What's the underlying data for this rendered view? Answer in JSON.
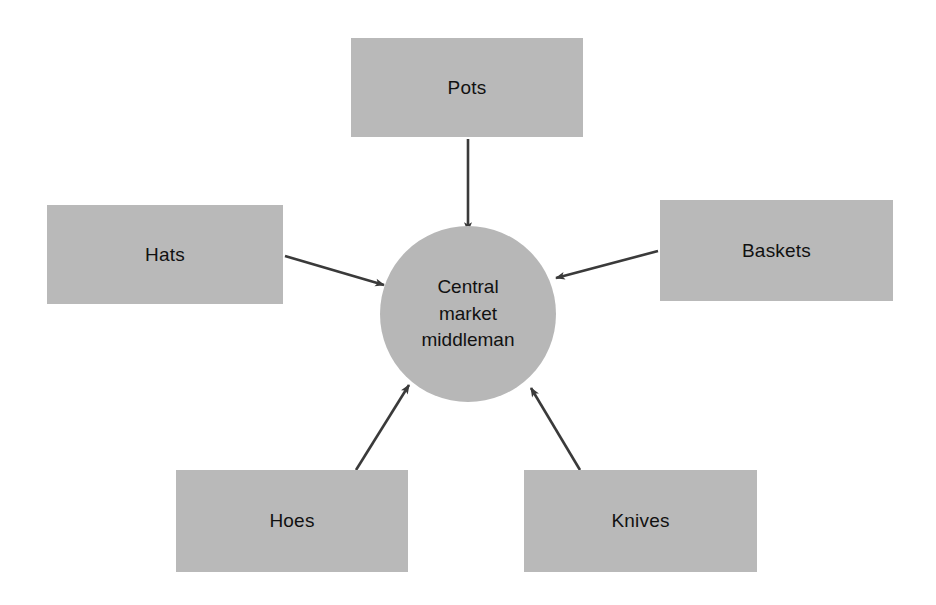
{
  "diagram": {
    "background_color": "#ffffff",
    "node_fill_color": "#b9b9b9",
    "hub_fill_color": "#b7b7b7",
    "arrow_color": "#3a3a3a",
    "text_color": "#111111",
    "hub": {
      "name": "central-market-middleman",
      "shape": "circle",
      "lines": [
        "Central",
        "market",
        "middleman"
      ],
      "center_x": 468,
      "center_y": 314,
      "diameter": 176
    },
    "nodes": [
      {
        "id": "pots",
        "label": "Pots",
        "shape": "rectangle",
        "x": 351,
        "y": 38,
        "width": 232,
        "height": 99
      },
      {
        "id": "hats",
        "label": "Hats",
        "shape": "rectangle",
        "x": 47,
        "y": 205,
        "width": 236,
        "height": 99
      },
      {
        "id": "baskets",
        "label": "Baskets",
        "shape": "rectangle",
        "x": 660,
        "y": 200,
        "width": 233,
        "height": 101
      },
      {
        "id": "hoes",
        "label": "Hoes",
        "shape": "rectangle",
        "x": 176,
        "y": 470,
        "width": 232,
        "height": 102
      },
      {
        "id": "knives",
        "label": "Knives",
        "shape": "rectangle",
        "x": 524,
        "y": 470,
        "width": 233,
        "height": 102
      }
    ],
    "edges": [
      {
        "id": "pots-to-hub",
        "from": "pots",
        "to": "central-market-middleman",
        "direction": "inbound",
        "x1": 468,
        "y1": 139,
        "x2": 468,
        "y2": 231
      },
      {
        "id": "hats-to-hub",
        "from": "hats",
        "to": "central-market-middleman",
        "direction": "inbound",
        "x1": 285,
        "y1": 256,
        "x2": 384,
        "y2": 285
      },
      {
        "id": "baskets-to-hub",
        "from": "baskets",
        "to": "central-market-middleman",
        "direction": "inbound",
        "x1": 658,
        "y1": 251,
        "x2": 556,
        "y2": 278
      },
      {
        "id": "hoes-to-hub",
        "from": "hoes",
        "to": "central-market-middleman",
        "direction": "inbound",
        "x1": 356,
        "y1": 470,
        "x2": 409,
        "y2": 385
      },
      {
        "id": "knives-to-hub",
        "from": "knives",
        "to": "central-market-middleman",
        "direction": "inbound",
        "x1": 580,
        "y1": 470,
        "x2": 531,
        "y2": 388
      }
    ]
  }
}
